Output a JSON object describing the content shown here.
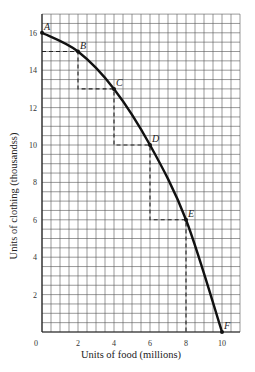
{
  "chart_data": {
    "type": "line",
    "title": "",
    "xlabel": "Units of food (millions)",
    "ylabel": "Units of clothing (thousandss)",
    "xlim": [
      0,
      11
    ],
    "ylim": [
      0,
      17
    ],
    "grid": true,
    "grid_minor_step": 0.5,
    "x_ticks": [
      0,
      2,
      4,
      6,
      8,
      10
    ],
    "y_ticks": [
      2,
      4,
      6,
      8,
      10,
      12,
      14,
      16
    ],
    "series": [
      {
        "name": "Production possibilities frontier",
        "points": [
          {
            "label": "A",
            "x": 0,
            "y": 16
          },
          {
            "label": "B",
            "x": 2,
            "y": 15
          },
          {
            "label": "C",
            "x": 4,
            "y": 13
          },
          {
            "label": "D",
            "x": 6,
            "y": 10
          },
          {
            "label": "E",
            "x": 8,
            "y": 6
          },
          {
            "label": "F",
            "x": 10,
            "y": 0
          }
        ]
      }
    ],
    "dashed_staircase": [
      [
        0,
        15
      ],
      [
        2,
        15
      ],
      [
        2,
        13
      ],
      [
        4,
        13
      ],
      [
        4,
        10
      ],
      [
        6,
        10
      ],
      [
        6,
        6
      ],
      [
        8,
        6
      ],
      [
        8,
        0
      ]
    ],
    "colors": {
      "curve": "#111111",
      "grid": "#555555",
      "dashes": "#222222"
    }
  }
}
